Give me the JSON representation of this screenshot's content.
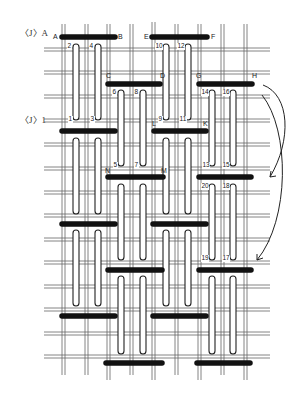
{
  "diagram": {
    "side_labels": [
      {
        "text": "〈J〉A",
        "x": 20,
        "y": 34
      },
      {
        "text": "〈J〉1",
        "x": 20,
        "y": 120
      }
    ],
    "point_labels": [
      {
        "text": "A",
        "x": 53,
        "y": 33
      },
      {
        "text": "B",
        "x": 118,
        "y": 33
      },
      {
        "text": "E",
        "x": 144,
        "y": 33
      },
      {
        "text": "F",
        "x": 211,
        "y": 33
      },
      {
        "text": "C",
        "x": 106,
        "y": 72
      },
      {
        "text": "D",
        "x": 160,
        "y": 72
      },
      {
        "text": "G",
        "x": 196,
        "y": 72
      },
      {
        "text": "H",
        "x": 252,
        "y": 72
      },
      {
        "text": "L",
        "x": 152,
        "y": 120
      },
      {
        "text": "K",
        "x": 203,
        "y": 120
      },
      {
        "text": "N",
        "x": 105,
        "y": 167
      },
      {
        "text": "M",
        "x": 161,
        "y": 167
      }
    ],
    "stitch_numbers": [
      {
        "text": "2",
        "x": 69,
        "y": 45
      },
      {
        "text": "4",
        "x": 91,
        "y": 45
      },
      {
        "text": "10",
        "x": 158,
        "y": 45
      },
      {
        "text": "12",
        "x": 180,
        "y": 45
      },
      {
        "text": "6",
        "x": 114,
        "y": 91
      },
      {
        "text": "8",
        "x": 136,
        "y": 91
      },
      {
        "text": "14",
        "x": 204,
        "y": 91
      },
      {
        "text": "16",
        "x": 225,
        "y": 91
      },
      {
        "text": "1",
        "x": 70,
        "y": 118
      },
      {
        "text": "3",
        "x": 92,
        "y": 118
      },
      {
        "text": "9",
        "x": 160,
        "y": 118
      },
      {
        "text": "11",
        "x": 181,
        "y": 118
      },
      {
        "text": "5",
        "x": 115,
        "y": 164
      },
      {
        "text": "7",
        "x": 136,
        "y": 164
      },
      {
        "text": "13",
        "x": 205,
        "y": 164
      },
      {
        "text": "15",
        "x": 225,
        "y": 164
      },
      {
        "text": "20",
        "x": 203,
        "y": 185
      },
      {
        "text": "18",
        "x": 225,
        "y": 185
      },
      {
        "text": "19",
        "x": 203,
        "y": 257
      },
      {
        "text": "17",
        "x": 225,
        "y": 257
      }
    ],
    "colors": {
      "bar": "#111111",
      "grid": "#555555",
      "loop_fill": "#ffffff",
      "loop_stroke": "#222222",
      "arrow": "#222222"
    }
  }
}
